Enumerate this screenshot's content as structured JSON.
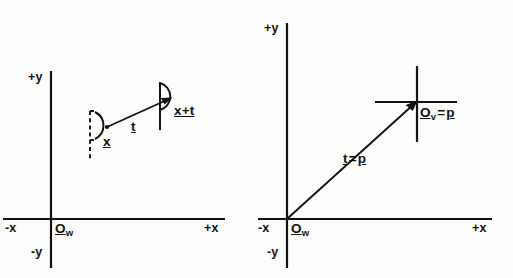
{
  "figure": {
    "background_color": "#fdfdfb",
    "ink_color": "#111111",
    "width": 513,
    "height": 278
  },
  "panels": [
    {
      "id": "left-panel",
      "name": "point-translation-diagram",
      "axes": {
        "x_negative_label": "-x",
        "x_positive_label": "+x",
        "y_positive_label": "+y",
        "y_negative_label": "-y",
        "origin_symbol": "O",
        "origin_subscript": "w"
      },
      "annotations": {
        "source_point_label": "x",
        "target_point_label": "x+t",
        "vector_label": "t"
      },
      "shapes": {
        "source_outline_style": "dashed",
        "target_outline_style": "solid",
        "connector": "arrow"
      }
    },
    {
      "id": "right-panel",
      "name": "frame-origin-diagram",
      "axes": {
        "x_negative_label": "-x",
        "x_positive_label": "+x",
        "y_positive_label": "+y",
        "y_negative_label": "-y",
        "origin_symbol": "O",
        "origin_subscript": "w"
      },
      "annotations": {
        "view_origin_symbol": "O",
        "view_origin_subscript": "v",
        "view_origin_equals": "=",
        "view_origin_value": "p",
        "vector_label_lhs": "t",
        "vector_label_equals": "=",
        "vector_label_rhs": "p"
      },
      "shapes": {
        "view_frame_marker": "cross",
        "connector": "arrow"
      }
    }
  ]
}
